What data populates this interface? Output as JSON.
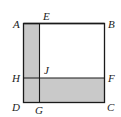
{
  "figure": {
    "shade_color": "#c9c9c9",
    "line_color": "#1a1a1a",
    "points": {
      "A": "A",
      "B": "B",
      "C": "C",
      "D": "D",
      "E": "E",
      "F": "F",
      "G": "G",
      "H": "H",
      "J": "J"
    }
  }
}
